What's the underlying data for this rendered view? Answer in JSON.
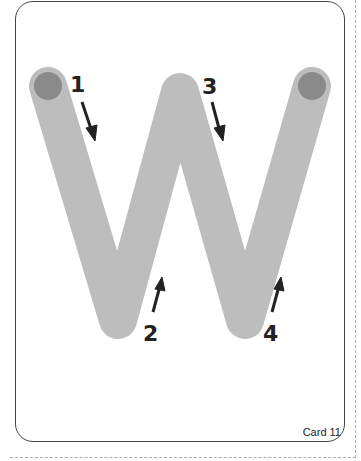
{
  "card": {
    "letter": "W",
    "label": "Card 11",
    "stroke_color": "#bdbdbd",
    "start_dot_color": "#8a8a8a",
    "arrow_color": "#222222"
  },
  "strokes": [
    {
      "number": "1",
      "direction": "down"
    },
    {
      "number": "2",
      "direction": "up"
    },
    {
      "number": "3",
      "direction": "down"
    },
    {
      "number": "4",
      "direction": "up"
    }
  ]
}
